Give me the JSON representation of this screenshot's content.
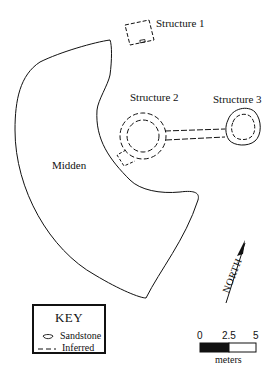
{
  "map": {
    "features": {
      "structure_1": {
        "label": "Structure 1"
      },
      "structure_2": {
        "label": "Structure 2"
      },
      "structure_3": {
        "label": "Structure 3"
      },
      "midden": {
        "label": "Midden"
      }
    },
    "north_arrow": {
      "label": "NORTH"
    },
    "key": {
      "title": "KEY",
      "items": [
        {
          "symbol": "sandstone-outline",
          "label": "Sandstone"
        },
        {
          "symbol": "dashed-line",
          "label": "Inferred"
        }
      ]
    },
    "scale_bar": {
      "ticks": [
        "0",
        "2.5",
        "5"
      ],
      "unit": "meters",
      "colors": {
        "filled": "#111111",
        "empty": "#ffffff"
      }
    }
  }
}
